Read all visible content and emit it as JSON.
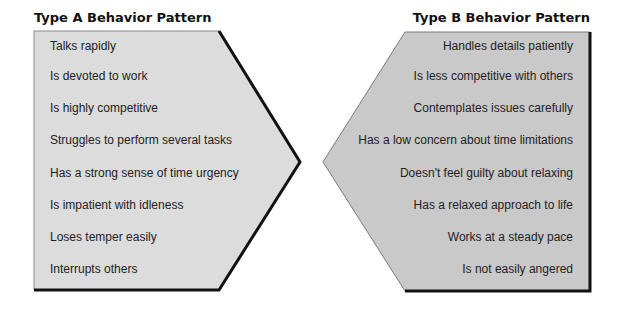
{
  "panels": {
    "type_a": {
      "title": "Type A Behavior Pattern",
      "fill": "#dcdcdc",
      "items": [
        "Talks rapidly",
        "Is devoted to work",
        "Is highly competitive",
        "Struggles to perform several tasks",
        "Has a strong sense of time urgency",
        "Is impatient with idleness",
        "Loses temper easily",
        "Interrupts others"
      ]
    },
    "type_b": {
      "title": "Type B Behavior Pattern",
      "fill": "#c8c8c8",
      "items": [
        "Handles details patiently",
        "Is less competitive with others",
        "Contemplates issues carefully",
        "Has a low concern about time limitations",
        "Doesn't feel guilty about relaxing",
        "Has a relaxed approach to life",
        "Works at a steady pace",
        "Is not easily angered"
      ]
    }
  }
}
